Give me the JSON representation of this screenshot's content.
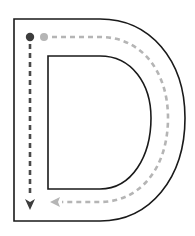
{
  "worksheet": {
    "letter": "D",
    "colors": {
      "outline": "#1a1a1a",
      "stroke1_path": "#4a4a4a",
      "stroke2_path": "#b5b5b5",
      "background": "#ffffff"
    },
    "strokes": [
      {
        "order": 1,
        "start_dot_color": "#3d3d3d",
        "direction": "down",
        "label": "Stroke 1"
      },
      {
        "order": 2,
        "start_dot_color": "#b5b5b5",
        "direction": "right-around-left",
        "label": "Stroke 2"
      }
    ]
  }
}
